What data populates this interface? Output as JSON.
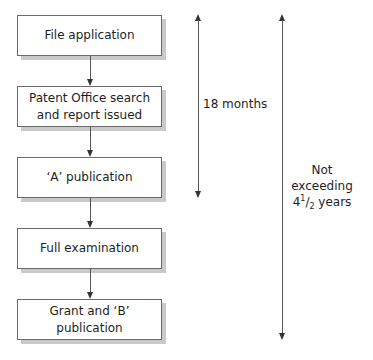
{
  "flowchart": {
    "steps": [
      {
        "label": "File application"
      },
      {
        "label": "Patent Office search and report issued"
      },
      {
        "label": "‘A’ publication"
      },
      {
        "label": "Full examination"
      },
      {
        "label": "Grant and ‘B’ publication"
      }
    ]
  },
  "timelines": {
    "short": {
      "label": "18 months",
      "from_step": 1,
      "to_step": 3
    },
    "long": {
      "label_line1": "Not exceeding",
      "label_whole": "4",
      "label_num": "1",
      "label_den": "2",
      "label_unit": " years",
      "from_step": 1,
      "to_step": 5
    }
  }
}
